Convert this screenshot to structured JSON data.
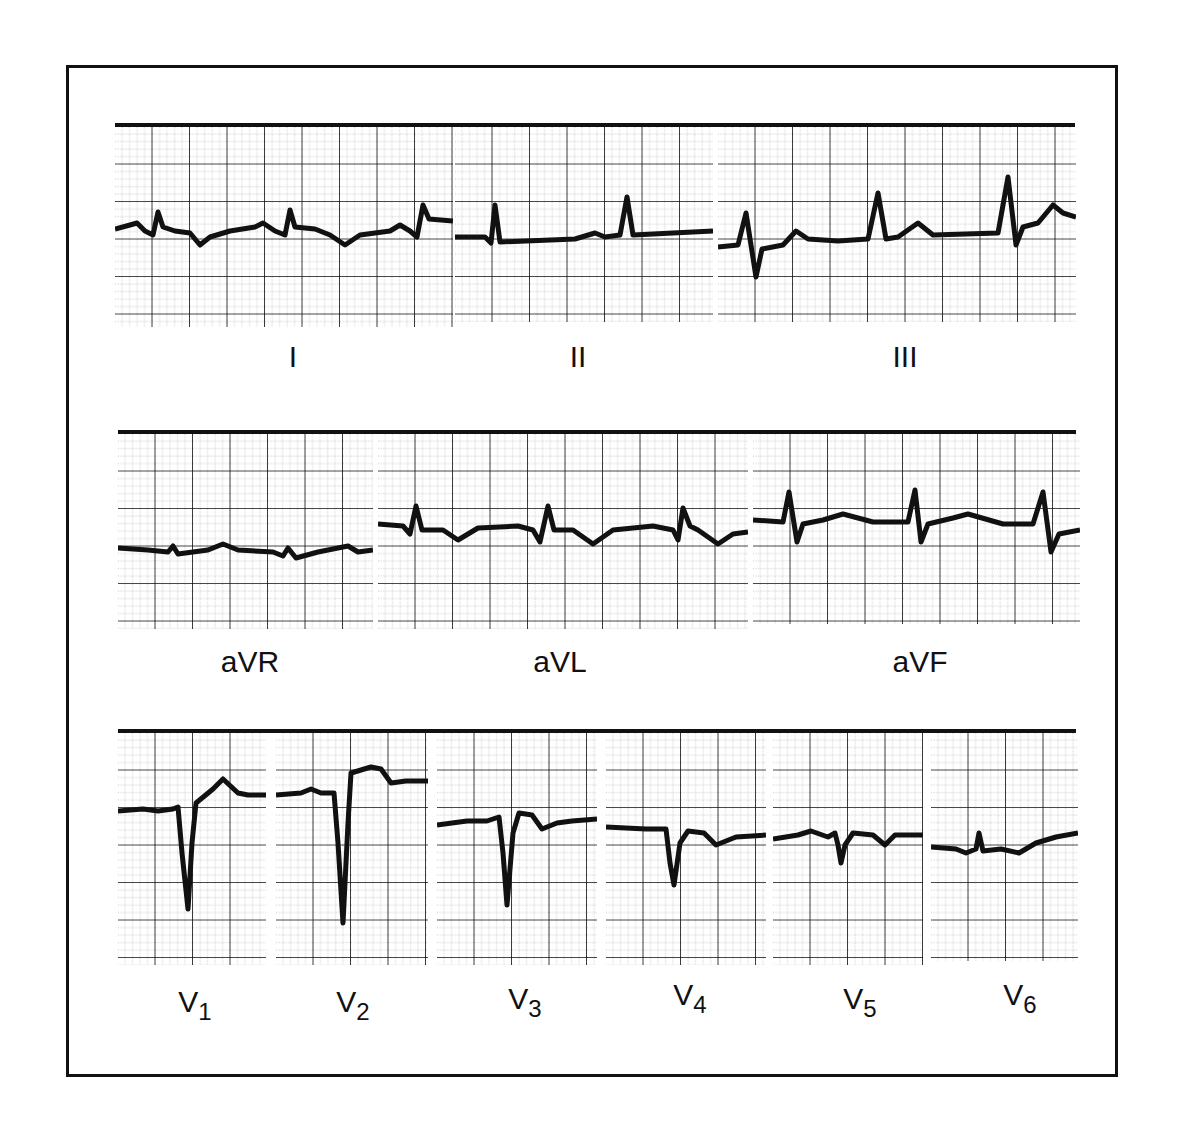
{
  "figure": {
    "rows": [
      {
        "leads": [
          {
            "id": "I",
            "label": "I",
            "sub": ""
          },
          {
            "id": "II",
            "label": "II",
            "sub": ""
          },
          {
            "id": "III",
            "label": "III",
            "sub": ""
          }
        ]
      },
      {
        "leads": [
          {
            "id": "aVR",
            "label": "aVR",
            "sub": ""
          },
          {
            "id": "aVL",
            "label": "aVL",
            "sub": ""
          },
          {
            "id": "aVF",
            "label": "aVF",
            "sub": ""
          }
        ]
      },
      {
        "leads": [
          {
            "id": "V1",
            "label": "V",
            "sub": "1"
          },
          {
            "id": "V2",
            "label": "V",
            "sub": "2"
          },
          {
            "id": "V3",
            "label": "V",
            "sub": "3"
          },
          {
            "id": "V4",
            "label": "V",
            "sub": "4"
          },
          {
            "id": "V5",
            "label": "V",
            "sub": "5"
          },
          {
            "id": "V6",
            "label": "V",
            "sub": "6"
          }
        ]
      }
    ],
    "colors": {
      "trace": "#111111",
      "grid": "#222222",
      "paper": "#ffffff",
      "frame": "#111111"
    }
  }
}
